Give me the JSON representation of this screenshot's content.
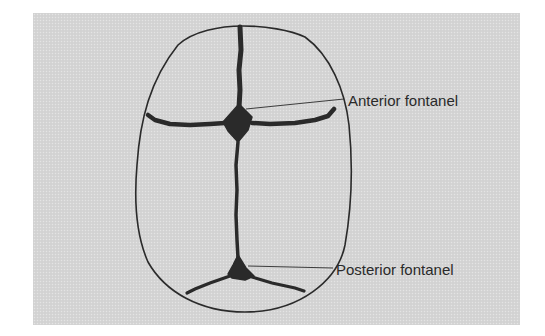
{
  "figure": {
    "background_color": "#d5d5d5",
    "line_color": "#2a2a2a",
    "labels": {
      "anterior": "Anterior fontanel",
      "posterior": "Posterior fontanel"
    },
    "structures": [
      {
        "name": "skull-outline",
        "shape": "ovoid, wider at bottom"
      },
      {
        "name": "sagittal-suture",
        "orientation": "vertical"
      },
      {
        "name": "coronal-suture",
        "orientation": "horizontal, upper"
      },
      {
        "name": "lambdoid-suture",
        "orientation": "inverted V, lower"
      },
      {
        "name": "anterior-fontanel",
        "shape": "diamond"
      },
      {
        "name": "posterior-fontanel",
        "shape": "triangle"
      }
    ]
  }
}
